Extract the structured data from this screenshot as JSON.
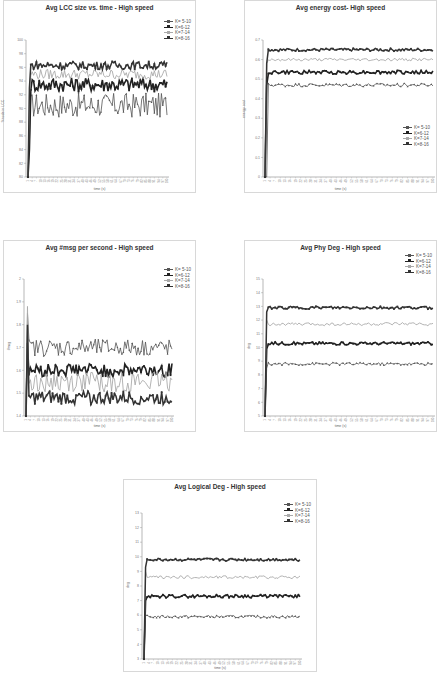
{
  "legend_labels": [
    "K= 5-10",
    "K=6-12",
    "K=7-14",
    "K=8-16"
  ],
  "series_colors": {
    "K= 5-10": "#555555",
    "K=6-12": "#222222",
    "K=7-14": "#aaaaaa",
    "K=8-16": "#333333"
  },
  "chart_data": [
    {
      "id": "lcc",
      "type": "line",
      "title": "Avg LCC size vs. time - High speed",
      "xlabel": "time (s)",
      "ylabel": "%node in LCC",
      "ylim": [
        80,
        100
      ],
      "yticks": [
        80,
        82,
        84,
        86,
        88,
        90,
        92,
        94,
        96,
        98,
        100
      ],
      "x_count": 100,
      "legend_position": "top-right",
      "series": [
        {
          "name": "K= 5-10",
          "level": 90.5,
          "noise": 1.2,
          "start": 85
        },
        {
          "name": "K=6-12",
          "level": 93.5,
          "noise": 0.7,
          "start": 84
        },
        {
          "name": "K=7-14",
          "level": 95.0,
          "noise": 0.5,
          "start": 92
        },
        {
          "name": "K=8-16",
          "level": 96.3,
          "noise": 0.4,
          "start": 93
        }
      ]
    },
    {
      "id": "energy",
      "type": "line",
      "title": "Avg energy cost- High speed",
      "xlabel": "time (s)",
      "ylabel": "energy cost",
      "ylim": [
        0,
        0.7
      ],
      "yticks": [
        0,
        0.1,
        0.2,
        0.3,
        0.4,
        0.5,
        0.6,
        0.7
      ],
      "x_count": 100,
      "legend_position": "right-middle",
      "series": [
        {
          "name": "K= 5-10",
          "level": 0.47,
          "noise": 0.006,
          "start": 0.0
        },
        {
          "name": "K=6-12",
          "level": 0.535,
          "noise": 0.006,
          "start": 0.47
        },
        {
          "name": "K=7-14",
          "level": 0.6,
          "noise": 0.005,
          "start": 0.58
        },
        {
          "name": "K=8-16",
          "level": 0.65,
          "noise": 0.005,
          "start": 0.58
        }
      ]
    },
    {
      "id": "msg",
      "type": "line",
      "title": "Avg #msg per second - High speed",
      "xlabel": "time (s)",
      "ylabel": "#msg",
      "ylim": [
        1.4,
        2.0
      ],
      "yticks": [
        1.4,
        1.5,
        1.6,
        1.7,
        1.8,
        1.9,
        2
      ],
      "x_count": 100,
      "legend_position": "top-right",
      "series": [
        {
          "name": "K= 5-10",
          "level": 1.7,
          "noise": 0.025,
          "start": 1.85
        },
        {
          "name": "K=6-12",
          "level": 1.6,
          "noise": 0.02,
          "start": 1.72
        },
        {
          "name": "K=7-14",
          "level": 1.55,
          "noise": 0.03,
          "start": 1.88
        },
        {
          "name": "K=8-16",
          "level": 1.48,
          "noise": 0.02,
          "start": 1.8
        }
      ]
    },
    {
      "id": "phydeg",
      "type": "line",
      "title": "Avg Phy Deg - High speed",
      "xlabel": "time (s)",
      "ylabel": "deg",
      "ylim": [
        5,
        15
      ],
      "yticks": [
        5,
        6,
        7,
        8,
        9,
        10,
        11,
        12,
        13,
        14,
        15
      ],
      "x_count": 100,
      "legend_position": "top-right",
      "series": [
        {
          "name": "K= 5-10",
          "level": 8.8,
          "noise": 0.07,
          "start": 8.5
        },
        {
          "name": "K=6-12",
          "level": 10.3,
          "noise": 0.07,
          "start": 9.9
        },
        {
          "name": "K=7-14",
          "level": 11.7,
          "noise": 0.08,
          "start": 12.0
        },
        {
          "name": "K=8-16",
          "level": 12.9,
          "noise": 0.07,
          "start": 12.6
        }
      ]
    },
    {
      "id": "logdeg",
      "type": "line",
      "title": "Avg Logical Deg - High speed",
      "xlabel": "time (s)",
      "ylabel": "deg",
      "ylim": [
        3,
        13
      ],
      "yticks": [
        3,
        4,
        5,
        6,
        7,
        8,
        9,
        10,
        11,
        12,
        13
      ],
      "x_count": 100,
      "legend_position": "top-right",
      "series": [
        {
          "name": "K= 5-10",
          "level": 5.9,
          "noise": 0.06,
          "start": 6.0
        },
        {
          "name": "K=6-12",
          "level": 7.3,
          "noise": 0.07,
          "start": 7.0
        },
        {
          "name": "K=7-14",
          "level": 8.6,
          "noise": 0.07,
          "start": 9.0
        },
        {
          "name": "K=8-16",
          "level": 9.8,
          "noise": 0.06,
          "start": 9.3
        }
      ]
    }
  ]
}
